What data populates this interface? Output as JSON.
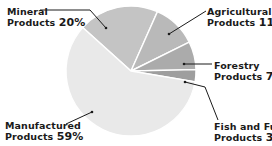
{
  "chart_data": {
    "type": "pie",
    "title": "",
    "start_angle_deg": -48,
    "direction": "clockwise",
    "center": [
      131,
      71
    ],
    "radius": 65,
    "slices": [
      {
        "name": "Mineral Products",
        "line1": "Mineral",
        "line2": "Products",
        "value": 20,
        "pct_label": "20%",
        "color": "#c4c4c4"
      },
      {
        "name": "Agricultural Products",
        "line1": "Agricultural",
        "line2": "Products",
        "value": 11,
        "pct_label": "11%",
        "color": "#b9b9b9"
      },
      {
        "name": "Forestry Products",
        "line1": "Forestry",
        "line2": "Products",
        "value": 7,
        "pct_label": "7%",
        "color": "#ababab"
      },
      {
        "name": "Fish and Fur Products",
        "line1": "Fish and Fur",
        "line2": "Products",
        "value": 3,
        "pct_label": "3%",
        "color": "#9e9e9e"
      },
      {
        "name": "Manufactured Products",
        "line1": "Manufactured",
        "line2": "Products",
        "value": 59,
        "pct_label": "59%",
        "color": "#e9e9e9"
      }
    ],
    "legend": "none (direct labels with leader lines)"
  }
}
